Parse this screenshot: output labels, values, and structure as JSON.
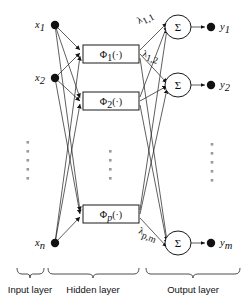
{
  "figure": {
    "background_color": "#ffffff",
    "line_color": "#1a1a1a",
    "ellipsis_color": "#9a9a9a"
  },
  "input_layer": {
    "label": "Input layer",
    "nodes": [
      {
        "id": "x1",
        "base": "x",
        "sub": "1",
        "x": 55,
        "y": 25
      },
      {
        "id": "x2",
        "base": "x",
        "sub": "2",
        "x": 55,
        "y": 78
      },
      {
        "id": "xn",
        "base": "x",
        "sub": "n",
        "x": 55,
        "y": 243
      }
    ],
    "ellipsis": {
      "x": 28,
      "y_start": 141,
      "count": 5,
      "spacing": 9
    }
  },
  "hidden_layer": {
    "label": "Hidden layer",
    "units": [
      {
        "id": "phi1",
        "text": "Φ",
        "sub": "1",
        "tail": "(·)",
        "cx": 111,
        "cy": 54
      },
      {
        "id": "phi2",
        "text": "Φ",
        "sub": "2",
        "tail": "(·)",
        "cx": 111,
        "cy": 101
      },
      {
        "id": "phip",
        "text": "Φ",
        "sub": "p",
        "tail": "(·)",
        "cx": 111,
        "cy": 214
      }
    ],
    "box_width": 56,
    "box_height": 18,
    "ellipsis": {
      "x": 110,
      "y_start": 150,
      "count": 4,
      "spacing": 9
    }
  },
  "output_layer": {
    "label": "Output layer",
    "sum_symbol": "Σ",
    "nodes": [
      {
        "id": "y1",
        "base": "y",
        "sub": "1",
        "cx": 178,
        "cy": 27,
        "dot_x": 211,
        "label_x": 222
      },
      {
        "id": "y2",
        "base": "y",
        "sub": "2",
        "cx": 178,
        "cy": 85,
        "dot_x": 211,
        "label_x": 222
      },
      {
        "id": "ym",
        "base": "y",
        "sub": "m",
        "cx": 178,
        "cy": 243,
        "dot_x": 211,
        "label_x": 222
      }
    ],
    "circle_rx": 13,
    "circle_ry": 12,
    "ellipsis": {
      "x": 212,
      "y_start": 143,
      "count": 5,
      "spacing": 9
    }
  },
  "weights": [
    {
      "id": "lambda_1_1",
      "base": "λ",
      "sub": "1,1",
      "x": 139,
      "y": 24,
      "rotate": -28
    },
    {
      "id": "lambda_1_2",
      "base": "λ",
      "sub": "1,2",
      "x": 142,
      "y": 56,
      "rotate": 18
    },
    {
      "id": "lambda_p_m",
      "base": "λ",
      "sub": "p,m",
      "x": 138,
      "y": 233,
      "rotate": 22
    }
  ],
  "braces": [
    {
      "id": "brace-input",
      "label": "Input layer",
      "x_start": 17,
      "x_end": 44,
      "label_x": 30
    },
    {
      "id": "brace-hidden",
      "label": "Hidden layer",
      "x_start": 48,
      "x_end": 139,
      "label_x": 93
    },
    {
      "id": "brace-output",
      "label": "Output layer",
      "x_start": 146,
      "x_end": 240,
      "label_x": 193
    }
  ],
  "brace_geometry": {
    "top_y": 268,
    "bottom_y": 276,
    "label_y": 292
  }
}
